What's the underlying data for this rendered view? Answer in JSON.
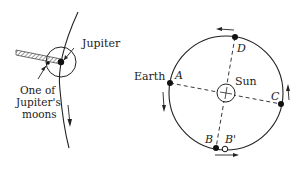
{
  "left_diagram": {
    "labels": {
      "jupiter": "Jupiter",
      "moon_line1": "One of",
      "moon_line2": "Jupiter's",
      "moon_line3": "moons"
    }
  },
  "right_diagram": {
    "labels": {
      "earth": "Earth",
      "sun": "Sun",
      "point_a": "A",
      "point_b": "B",
      "point_b_prime": "B'",
      "point_c": "C",
      "point_d": "D"
    }
  },
  "colors": {
    "ink": "#222222",
    "background": "#ffffff"
  }
}
